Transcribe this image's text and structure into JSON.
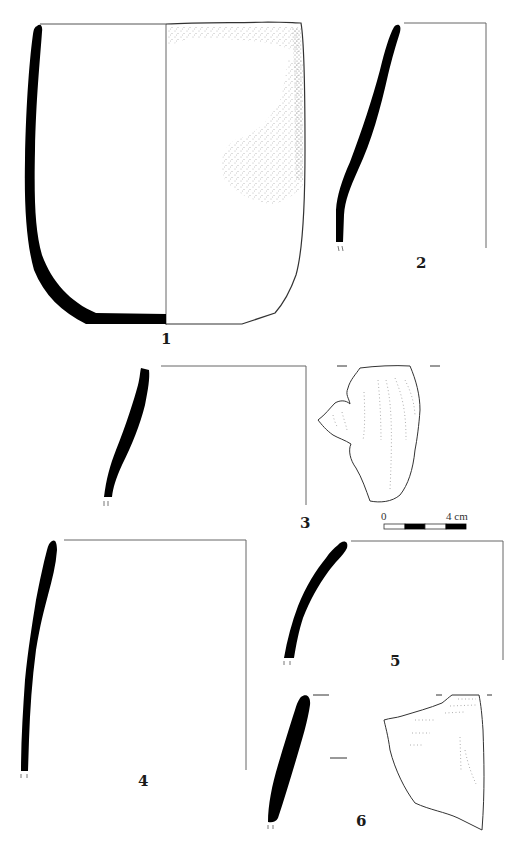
{
  "figure": {
    "type": "archaeological pottery profile plate",
    "colors": {
      "section_fill": "#000000",
      "outline": "#333333",
      "axis_line": "#666666",
      "stipple": "#777777",
      "background": "#ffffff"
    },
    "vessels": [
      {
        "id": "1",
        "label": "1",
        "description": "Complete deep vessel with flat base: left half black section profile, right half exterior view with stippled surface"
      },
      {
        "id": "2",
        "label": "2",
        "description": "Rim sherd section profile with rim-line and vertical axis"
      },
      {
        "id": "3",
        "label": "3",
        "description": "Rim sherd section profile with exterior view showing lug handle and dotted surface lines"
      },
      {
        "id": "4",
        "label": "4",
        "description": "Tall rim sherd section profile with axis lines"
      },
      {
        "id": "5",
        "label": "5",
        "description": "Curved rim sherd section profile with axis lines"
      },
      {
        "id": "6",
        "label": "6",
        "description": "Rim sherd section profile with exterior view of fragment showing dotted surface lines"
      }
    ],
    "scale_bar": {
      "start_label": "0",
      "end_label": "4 cm",
      "segments": 4
    }
  }
}
